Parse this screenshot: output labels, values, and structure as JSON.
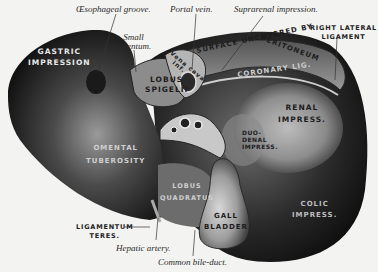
{
  "figure": {
    "labels": {
      "oesophageal_groove": "Œsophageal groove.",
      "portal_vein": "Portal vein.",
      "suprarenal_impression": "Suprarenal impression.",
      "right_lateral_ligament_1": "RIGHT LATERAL",
      "right_lateral_ligament_2": "LIGAMENT",
      "gastric_impression_1": "GASTRIC",
      "gastric_impression_2": "IMPRESSION",
      "small_omentum_1": "Small",
      "small_omentum_2": "omentum.",
      "vena_cava_1": "Vena cava",
      "vena_cava_2": "inf.",
      "surface_uncovered": "SURFACE UNCOVERED BY",
      "peritoneum": "PERITONEUM",
      "lobus_spigelii_1": "LOBUS",
      "lobus_spigelii_2": "SPIGELII",
      "coronary_lig": "CORONARY LIG.",
      "renal_impress_1": "RENAL",
      "renal_impress_2": "IMPRESS.",
      "duodenal_impress_1": "DUO-",
      "duodenal_impress_2": "DENAL",
      "duodenal_impress_3": "IMPRESS.",
      "omental_tuberosity_1": "OMENTAL",
      "omental_tuberosity_2": "TUBEROSITY",
      "lobus_quadratus_1": "LOBUS",
      "lobus_quadratus_2": "QUADRATUS",
      "gall_bladder_1": "GALL",
      "gall_bladder_2": "BLADDER",
      "colic_impress_1": "COLIC",
      "colic_impress_2": "IMPRESS.",
      "ligamentum_teres_1": "LIGAMENTUM",
      "ligamentum_teres_2": "TERES.",
      "hepatic_artery": "Hepatic artery.",
      "common_bile_duct": "Common bile-duct."
    }
  }
}
